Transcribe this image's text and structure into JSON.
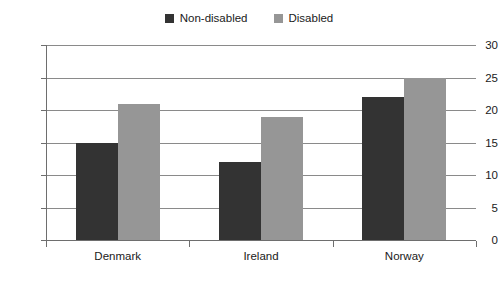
{
  "chart_data": {
    "type": "bar",
    "title": "",
    "subtitle": "",
    "xlabel": "",
    "ylabel": "",
    "categories": [
      "Denmark",
      "Ireland",
      "Norway"
    ],
    "series": [
      {
        "name": "Non-disabled",
        "values": [
          15,
          12,
          22
        ],
        "color": "#333333"
      },
      {
        "name": "Disabled",
        "values": [
          21,
          19,
          25
        ],
        "color": "#969696"
      }
    ],
    "ylim": [
      0,
      30
    ],
    "ytick_labels": [
      "0",
      "5",
      "10",
      "15",
      "20",
      "25",
      "30"
    ],
    "ytick_values": [
      0,
      5,
      10,
      15,
      20,
      25,
      30
    ],
    "grid": true,
    "grid_axis": "y",
    "legend_position": "top-center",
    "background_color": "#ffffff",
    "axis_color": "#6e6e6e",
    "grid_color": "#8a8a8a",
    "text_color": "#1a1a1a"
  }
}
